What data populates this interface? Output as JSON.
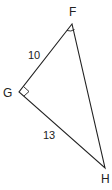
{
  "diagram": {
    "type": "right-triangle",
    "vertices": {
      "F": {
        "label": "F",
        "x": 72,
        "y": 24
      },
      "G": {
        "label": "G",
        "x": 19,
        "y": 92
      },
      "H": {
        "label": "H",
        "x": 105,
        "y": 168
      }
    },
    "sides": {
      "FG": {
        "label": "10"
      },
      "GH": {
        "label": "13"
      },
      "FH": {
        "label": ""
      }
    },
    "right_angle_at": "G",
    "angle_marked_at": "F",
    "stroke_color": "#222222"
  }
}
